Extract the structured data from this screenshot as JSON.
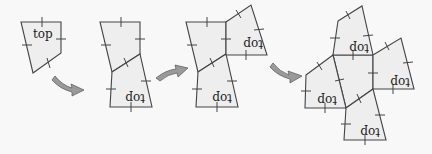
{
  "diagram": {
    "type": "folding-net-sequence",
    "label_text": "top",
    "colors": {
      "background": "#f8f8f8",
      "fill": "#eeeeee",
      "stroke": "#444444",
      "arrow": "#9a9a9a"
    },
    "steps": [
      {
        "id": 1,
        "labels": [
          "top"
        ]
      },
      {
        "id": 2,
        "labels": [
          "top"
        ]
      },
      {
        "id": 3,
        "labels": [
          "top",
          "top"
        ]
      },
      {
        "id": 4,
        "labels": [
          "top",
          "top",
          "top",
          "top"
        ]
      }
    ]
  }
}
